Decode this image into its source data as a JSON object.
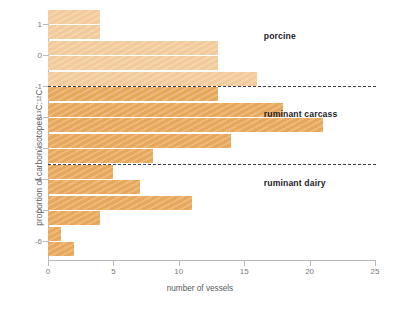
{
  "chart_data": {
    "type": "bar",
    "orientation": "horizontal",
    "title": "",
    "xlabel": "number of vessels",
    "ylabel": "proportion of carbon isotopes 13C:12C",
    "ylabel_parts": {
      "text": "proportion of carbon isotopes ",
      "sup1": "13",
      "mid": "C:",
      "sup2": "12",
      "end": "C"
    },
    "xlim": [
      0,
      25
    ],
    "ylim": [
      -6.6,
      1.4
    ],
    "xticks": [
      0,
      5,
      10,
      15,
      20,
      25
    ],
    "xtick_labels": [
      "0",
      "5",
      "10",
      "15",
      "20",
      "25"
    ],
    "yticks": [
      1,
      0,
      -1,
      -2,
      -3,
      -4,
      -5,
      -6
    ],
    "ytick_labels": [
      "1",
      "0",
      "-1",
      "-2",
      "-3",
      "-4",
      "-5",
      "-6"
    ],
    "grid": false,
    "legend": "none",
    "bin_width": 0.5,
    "categories": [
      1.25,
      0.75,
      0.25,
      -0.25,
      -0.75,
      -1.25,
      -1.75,
      -2.25,
      -2.75,
      -3.25,
      -3.75,
      -4.25,
      -4.75,
      -5.25,
      -5.75,
      -6.25
    ],
    "values": [
      4,
      4,
      13,
      13,
      16,
      13,
      18,
      21,
      14,
      8,
      5,
      7,
      11,
      4,
      1,
      2
    ],
    "bar_shades": [
      "light",
      "light",
      "light",
      "light",
      "light",
      "dark",
      "dark",
      "dark",
      "dark",
      "dark",
      "dark",
      "dark",
      "dark",
      "dark",
      "dark",
      "dark"
    ],
    "colors": {
      "bar_light": "#f3cb9b",
      "bar_dark": "#e8a85c",
      "axis": "#b9b9b9",
      "tick_text": "#7a7a7a",
      "label_text": "#5a5a5a",
      "divider": "#3c3c46",
      "annotation_text": "#23232b",
      "background": "#ffffff"
    },
    "dividers": [
      {
        "name": "porcine-ruminant-carcass-divider",
        "y_value": -1.0
      },
      {
        "name": "ruminant-carcass-ruminant-dairy-divider",
        "y_value": -3.5
      }
    ],
    "annotations": [
      {
        "name": "porcine",
        "label": "porcine",
        "x_value": 16.5,
        "y_value": 0.62
      },
      {
        "name": "ruminant-carcass",
        "label": "ruminant carcass",
        "x_value": 16.5,
        "y_value": -1.88
      },
      {
        "name": "ruminant-dairy",
        "label": "ruminant dairy",
        "x_value": 16.5,
        "y_value": -4.12
      }
    ]
  }
}
